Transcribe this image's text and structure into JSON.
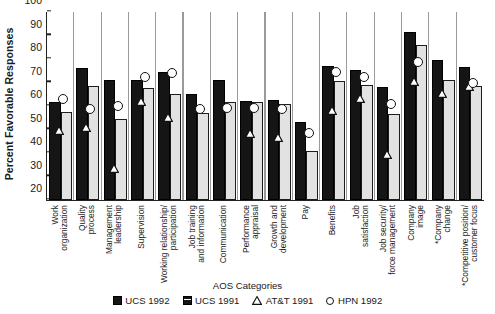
{
  "chart_data": {
    "type": "bar",
    "title": "",
    "xlabel": "AOS Categories",
    "ylabel": "Percent Favorable Responses",
    "ylim": [
      20,
      100
    ],
    "yticks": [
      20,
      30,
      40,
      50,
      60,
      70,
      80,
      90,
      100
    ],
    "grid": false,
    "legend_position": "bottom",
    "categories": [
      "Work organization",
      "Quality process",
      "Management leadership",
      "Supervision",
      "Working relationship/ participation",
      "Job training and information",
      "Communication",
      "Performance appraisal",
      "Growth and development",
      "Pay",
      "Benefits",
      "Job satisfaction",
      "Job security/ force management",
      "Company image",
      "*Company change",
      "*Competitive position/ customer focus"
    ],
    "category_lines": [
      [
        "Work",
        "organization"
      ],
      [
        "Quality",
        "process"
      ],
      [
        "Management",
        "leadership"
      ],
      [
        "Supervision"
      ],
      [
        "Working relationship/",
        "participation"
      ],
      [
        "Job training",
        "and information"
      ],
      [
        "Communication"
      ],
      [
        "Performance",
        "appraisal"
      ],
      [
        "Growth and",
        "development"
      ],
      [
        "Pay"
      ],
      [
        "Benefits"
      ],
      [
        "Job",
        "satisfaction"
      ],
      [
        "Job security/",
        "force management"
      ],
      [
        "Company",
        "image"
      ],
      [
        "*Company",
        "change"
      ],
      [
        "*Competitive position/",
        "customer focus"
      ]
    ],
    "series": [
      {
        "name": "UCS 1992",
        "type": "bar",
        "color": "#151515",
        "values": [
          61.5,
          76,
          71,
          71,
          74.5,
          65,
          71,
          62,
          62.5,
          53,
          77,
          75.5,
          68,
          91.5,
          79.5,
          76.5
        ]
      },
      {
        "name": "UCS 1991",
        "type": "bar",
        "color": "#e2e2e2",
        "values": [
          57.5,
          68.5,
          54.5,
          67.5,
          65,
          57,
          61.5,
          61.5,
          61,
          41,
          70.5,
          69,
          56.5,
          86,
          71,
          68.5
        ]
      },
      {
        "name": "AT&T 1991",
        "type": "marker-triangle",
        "color": "#ffffff",
        "values": [
          49.5,
          51,
          33.5,
          62,
          55,
          null,
          null,
          48.5,
          46.5,
          null,
          58,
          63,
          39.5,
          70.5,
          65.5,
          68.5
        ]
      },
      {
        "name": "HPN 1992",
        "type": "marker-circle",
        "color": "#ffffff",
        "values": [
          60.5,
          56.5,
          57.5,
          70,
          71.5,
          56.5,
          57,
          57,
          56.5,
          46,
          72,
          70,
          58.5,
          76.5,
          null,
          67.5
        ]
      }
    ]
  },
  "legend": [
    {
      "label": "UCS 1992",
      "swatch": "dark-square"
    },
    {
      "label": "UCS 1991",
      "swatch": "light-square"
    },
    {
      "label": "AT&T 1991",
      "swatch": "open-triangle"
    },
    {
      "label": "HPN 1992",
      "swatch": "open-circle"
    }
  ],
  "axes": {
    "y_title": "Percent Favorable Responses",
    "x_title": "AOS Categories",
    "y_tick_labels": [
      "100",
      "90",
      "80",
      "70",
      "60",
      "50",
      "40",
      "30",
      "20"
    ]
  }
}
